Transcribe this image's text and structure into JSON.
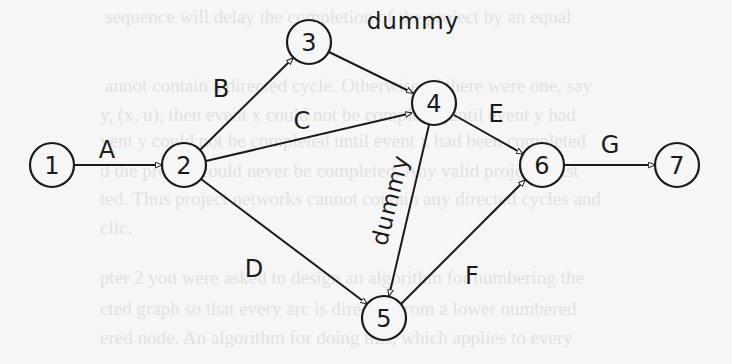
{
  "diagram": {
    "type": "activity-on-arrow project network",
    "nodes": [
      {
        "id": "1",
        "label": "1",
        "x": 52,
        "y": 165
      },
      {
        "id": "2",
        "label": "2",
        "x": 184,
        "y": 165
      },
      {
        "id": "3",
        "label": "3",
        "x": 309,
        "y": 42
      },
      {
        "id": "4",
        "label": "4",
        "x": 434,
        "y": 103
      },
      {
        "id": "5",
        "label": "5",
        "x": 384,
        "y": 318
      },
      {
        "id": "6",
        "label": "6",
        "x": 542,
        "y": 165
      },
      {
        "id": "7",
        "label": "7",
        "x": 677,
        "y": 165
      }
    ],
    "edges": [
      {
        "from": "1",
        "to": "2",
        "label": "A"
      },
      {
        "from": "2",
        "to": "3",
        "label": "B"
      },
      {
        "from": "2",
        "to": "4",
        "label": "C"
      },
      {
        "from": "2",
        "to": "5",
        "label": "D"
      },
      {
        "from": "3",
        "to": "4",
        "label": "dummy"
      },
      {
        "from": "4",
        "to": "6",
        "label": "E"
      },
      {
        "from": "4",
        "to": "5",
        "label": "dummy"
      },
      {
        "from": "5",
        "to": "6",
        "label": "F"
      },
      {
        "from": "6",
        "to": "7",
        "label": "G"
      }
    ]
  },
  "background_text": [
    "sequence will delay the completion of the project by an equal",
    "annot contain a directed cycle. Otherwise, if there were one, say",
    "y, (x, u), then event x could not be completed until event y had",
    "vent y could not be completed until event x had been completed",
    "d the project could never be completed. Any valid project must",
    "ted. Thus project networks cannot contain any directed cycles and",
    "clic.",
    "pter 2 you were asked to design an algorithm for numbering the",
    "cted graph so that every arc is directed from a lower numbered",
    "ered node. An algorithm for doing this, which applies to every"
  ]
}
